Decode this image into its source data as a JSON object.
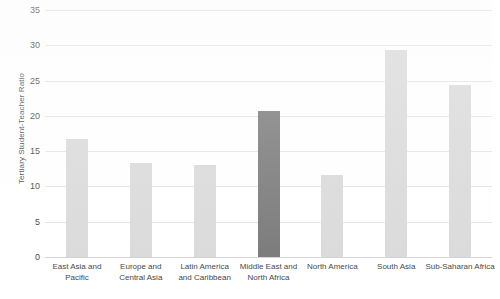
{
  "chart_data": {
    "type": "bar",
    "title": "",
    "subtitle": "",
    "xlabel": "",
    "ylabel": "Tertiary Student-Teacher Ratio",
    "ylim": [
      0,
      35
    ],
    "ytick_step": 5,
    "yticks": [
      "0",
      "5",
      "10",
      "15",
      "20",
      "25",
      "30",
      "35"
    ],
    "grid": true,
    "legend": "none",
    "categories": [
      "East Asia and Pacific",
      "Europe and Central Asia",
      "Latin America and Caribbean",
      "Middle East and North Africa",
      "North America",
      "South Asia",
      "Sub-Saharan Africa"
    ],
    "category_lines": [
      [
        "East Asia and",
        "Pacific"
      ],
      [
        "Europe and",
        "Central Asia"
      ],
      [
        "Latin America",
        "and Caribbean"
      ],
      [
        "Middle East and",
        "North Africa"
      ],
      [
        "North America",
        ""
      ],
      [
        "South Asia",
        ""
      ],
      [
        "Sub-Saharan Africa",
        ""
      ]
    ],
    "values": [
      16.7,
      13.3,
      13.1,
      20.7,
      11.6,
      29.3,
      24.4
    ],
    "highlight_index": 3,
    "colors": {
      "bar": "#d9d9d9",
      "bar_highlight": "#767676",
      "gridline": "#e4e4e4",
      "baseline": "#d2d2d2",
      "text": "#3f3f3f",
      "background": "#ffffff"
    }
  }
}
